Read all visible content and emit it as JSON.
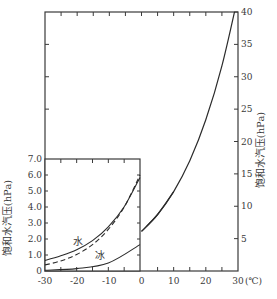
{
  "chart_data": [
    {
      "type": "line",
      "title": "",
      "xlabel": "(℃)",
      "ylabel": "饱和水汽压(hPa)",
      "y_axis_side": "right",
      "xlim": [
        -30,
        30
      ],
      "ylim": [
        0,
        40
      ],
      "x_ticks": [
        -30,
        -20,
        -10,
        0,
        10,
        20,
        30
      ],
      "x_tick_labels": [
        "-30",
        "-20",
        "-10",
        "0",
        "10",
        "20",
        "30"
      ],
      "y_ticks": [
        5,
        10,
        15,
        20,
        25,
        30,
        35,
        40
      ],
      "y_tick_labels": [
        "5",
        "10",
        "15",
        "20",
        "25",
        "30",
        "35",
        "40"
      ],
      "grid": false,
      "series": [
        {
          "name": "饱和水汽压(水面)",
          "style": "solid",
          "x": [
            -30,
            -20,
            -10,
            0,
            5,
            10,
            15,
            20,
            25,
            30
          ],
          "values": [
            0.51,
            1.25,
            2.86,
            6.11,
            8.72,
            12.27,
            17.04,
            23.37,
            31.67,
            42.43
          ]
        }
      ]
    },
    {
      "type": "line",
      "title": "",
      "inset": true,
      "xlabel": "",
      "ylabel": "饱和水汽压(hPa)",
      "xlim": [
        -30,
        0
      ],
      "ylim": [
        0,
        7.0
      ],
      "x_ticks": [
        -30,
        -25,
        -20,
        -15,
        -10,
        -5,
        0
      ],
      "y_ticks": [
        0,
        1.0,
        2.0,
        3.0,
        4.0,
        5.0,
        6.0,
        7.0
      ],
      "y_tick_labels": [
        "0",
        "1.0",
        "2.0",
        "3.0",
        "4.0",
        "5.0",
        "6.0",
        "7.0"
      ],
      "grid": false,
      "annotations": [
        "水",
        "冰"
      ],
      "series": [
        {
          "name": "水",
          "style": "solid",
          "x": [
            -30,
            -25,
            -20,
            -15,
            -10,
            -5,
            0
          ],
          "values": [
            0.66,
            0.95,
            1.33,
            1.9,
            2.76,
            4.01,
            5.85
          ]
        },
        {
          "name": "冰",
          "style": "dashed",
          "x": [
            -30,
            -25,
            -20,
            -15,
            -10,
            -5,
            0
          ],
          "values": [
            0.38,
            0.63,
            1.03,
            1.65,
            2.6,
            3.99,
            6.0
          ]
        },
        {
          "name": "主曲线延续",
          "style": "solid",
          "x": [
            -30,
            -20,
            -10,
            0
          ],
          "values": [
            0.05,
            0.15,
            0.5,
            1.65
          ]
        }
      ]
    }
  ],
  "labels": {
    "right_axis_title": "饱和水汽压(hPa)",
    "left_axis_title": "饱和水汽压(hPa)",
    "x_unit": "(℃)",
    "water": "水",
    "ice": "冰"
  },
  "colors": {
    "line": "#2b2b2b",
    "axis": "#3a3a3a",
    "text": "#3a3a3a",
    "background": "#ffffff"
  }
}
